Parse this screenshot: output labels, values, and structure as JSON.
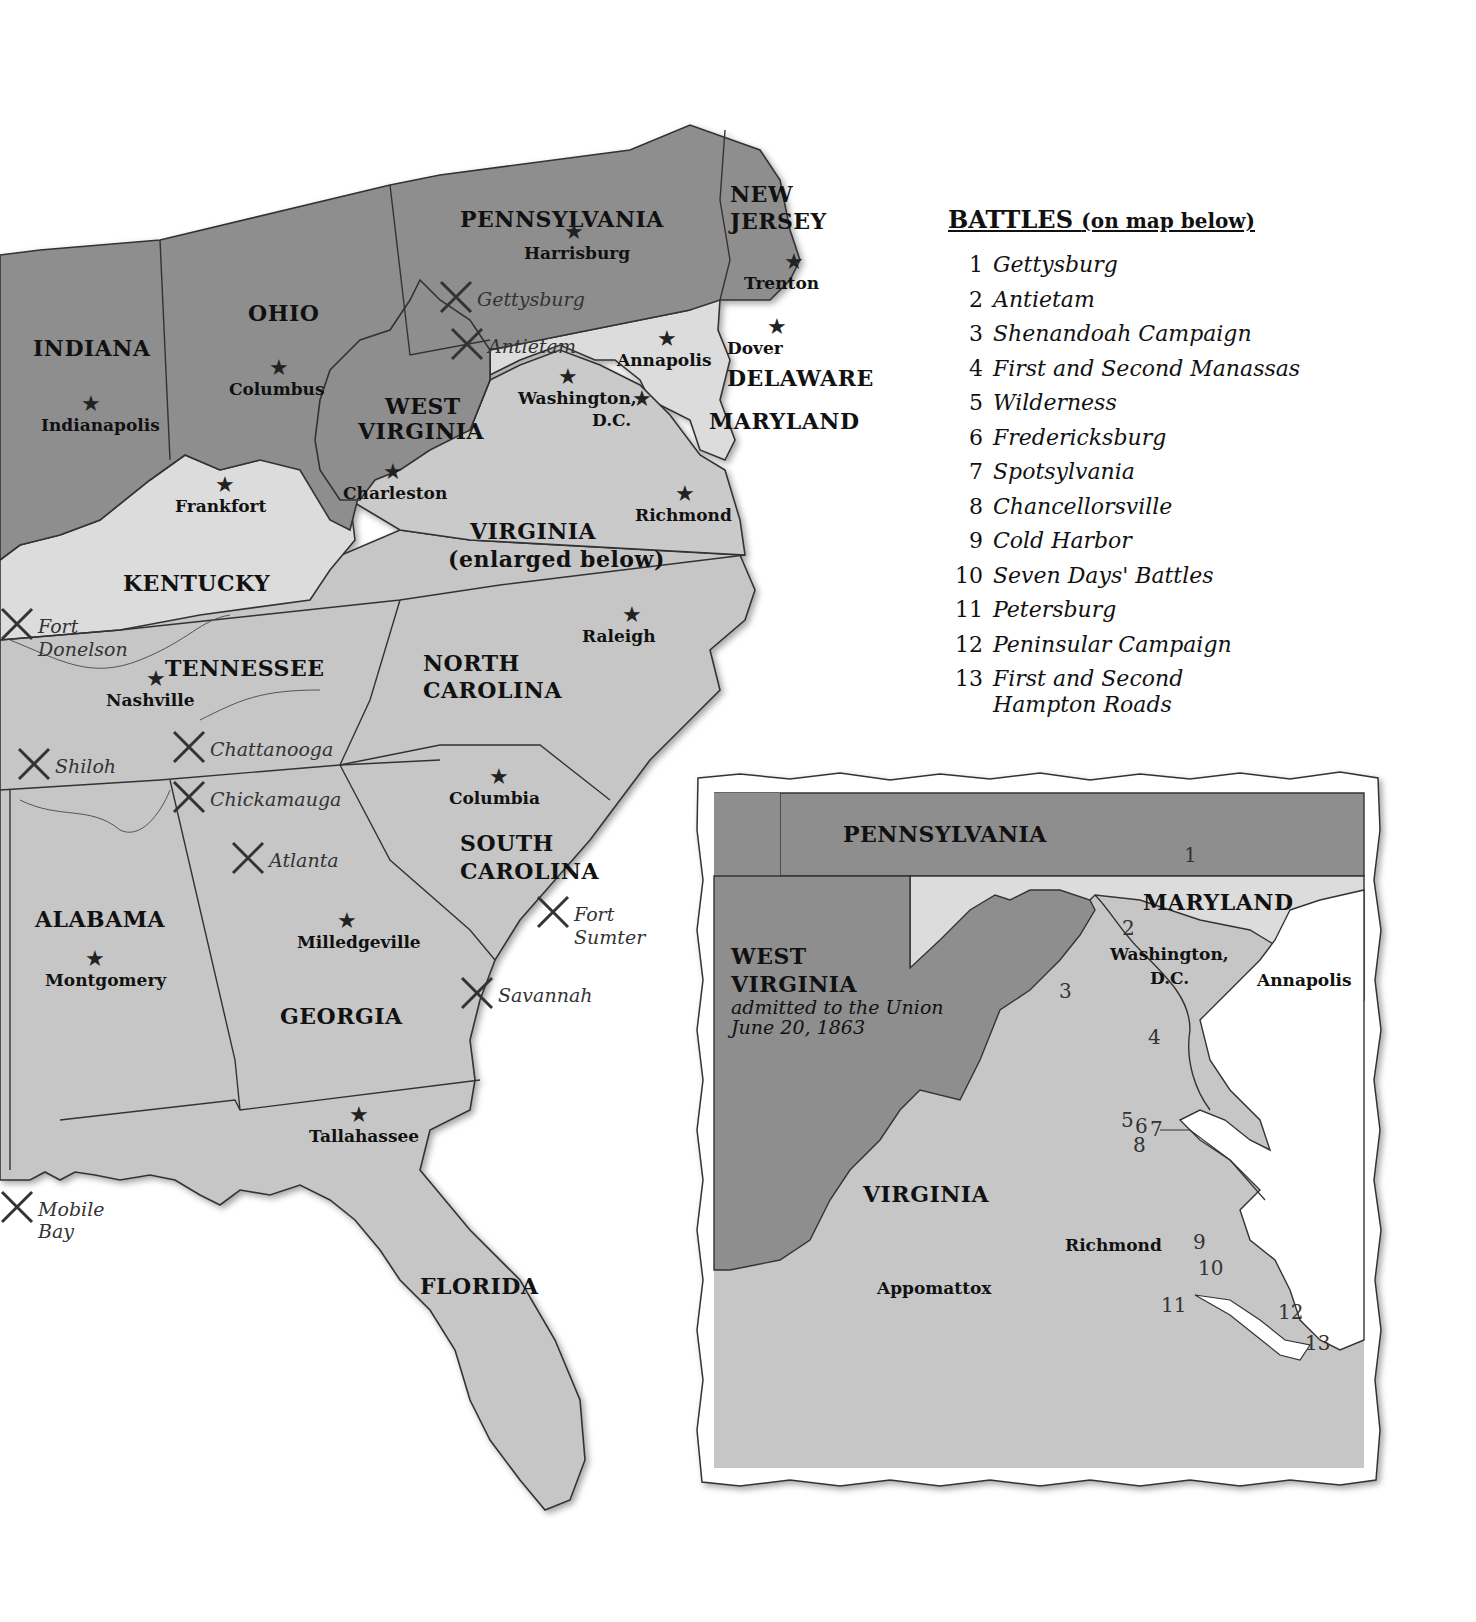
{
  "legend": {
    "title": "BATTLES",
    "subtitle": "(on map below)",
    "items": [
      {
        "num": "1",
        "name": "Gettysburg"
      },
      {
        "num": "2",
        "name": "Antietam"
      },
      {
        "num": "3",
        "name": "Shenandoah Campaign"
      },
      {
        "num": "4",
        "name": "First and Second Manassas"
      },
      {
        "num": "5",
        "name": "Wilderness"
      },
      {
        "num": "6",
        "name": "Fredericksburg"
      },
      {
        "num": "7",
        "name": "Spotsylvania"
      },
      {
        "num": "8",
        "name": "Chancellorsville"
      },
      {
        "num": "9",
        "name": "Cold Harbor"
      },
      {
        "num": "10",
        "name": "Seven Days' Battles"
      },
      {
        "num": "11",
        "name": "Petersburg"
      },
      {
        "num": "12",
        "name": "Peninsular Campaign"
      },
      {
        "num": "13",
        "name": "First and Second Hampton Roads"
      }
    ]
  },
  "main_map": {
    "colors": {
      "union": "#8f8f8f",
      "border_state": "#d8d8d8",
      "confederate": "#c4c4c4",
      "water": "#ffffff",
      "line": "#333333"
    },
    "states": [
      {
        "name": "PENNSYLVANIA",
        "x": 460,
        "y": 208
      },
      {
        "name": "NEW",
        "x": 730,
        "y": 183
      },
      {
        "name": "JERSEY",
        "x": 730,
        "y": 210
      },
      {
        "name": "OHIO",
        "x": 248,
        "y": 302
      },
      {
        "name": "INDIANA",
        "x": 33,
        "y": 337
      },
      {
        "name": "WEST",
        "x": 385,
        "y": 395
      },
      {
        "name": "VIRGINIA",
        "x": 358,
        "y": 420
      },
      {
        "name": "DELAWARE",
        "x": 727,
        "y": 367
      },
      {
        "name": "MARYLAND",
        "x": 709,
        "y": 410
      },
      {
        "name": "VIRGINIA",
        "x": 470,
        "y": 520
      },
      {
        "name": "(enlarged below)",
        "x": 448,
        "y": 548
      },
      {
        "name": "KENTUCKY",
        "x": 123,
        "y": 572
      },
      {
        "name": "TENNESSEE",
        "x": 165,
        "y": 657
      },
      {
        "name": "NORTH",
        "x": 423,
        "y": 652
      },
      {
        "name": "CAROLINA",
        "x": 423,
        "y": 679
      },
      {
        "name": "SOUTH",
        "x": 460,
        "y": 832
      },
      {
        "name": "CAROLINA",
        "x": 460,
        "y": 860
      },
      {
        "name": "ALABAMA",
        "x": 35,
        "y": 908
      },
      {
        "name": "GEORGIA",
        "x": 280,
        "y": 1005
      },
      {
        "name": "FLORIDA",
        "x": 420,
        "y": 1275
      }
    ],
    "capitals": [
      {
        "name": "Harrisburg",
        "x": 524,
        "y": 245
      },
      {
        "name": "Trenton",
        "x": 744,
        "y": 275
      },
      {
        "name": "Dover",
        "x": 727,
        "y": 340
      },
      {
        "name": "Annapolis",
        "x": 617,
        "y": 352
      },
      {
        "name": "Washington,",
        "x": 518,
        "y": 390
      },
      {
        "name": "D.C.",
        "x": 592,
        "y": 412
      },
      {
        "name": "Columbus",
        "x": 229,
        "y": 381
      },
      {
        "name": "Indianapolis",
        "x": 41,
        "y": 417
      },
      {
        "name": "Charleston",
        "x": 343,
        "y": 485
      },
      {
        "name": "Frankfort",
        "x": 175,
        "y": 498
      },
      {
        "name": "Richmond",
        "x": 635,
        "y": 507
      },
      {
        "name": "Raleigh",
        "x": 582,
        "y": 628
      },
      {
        "name": "Nashville",
        "x": 106,
        "y": 692
      },
      {
        "name": "Columbia",
        "x": 449,
        "y": 790
      },
      {
        "name": "Milledgeville",
        "x": 297,
        "y": 934
      },
      {
        "name": "Montgomery",
        "x": 45,
        "y": 972
      },
      {
        "name": "Tallahassee",
        "x": 309,
        "y": 1128
      }
    ],
    "battles": [
      {
        "name": "Gettysburg",
        "x": 477,
        "y": 290
      },
      {
        "name": "Antietam",
        "x": 488,
        "y": 337
      },
      {
        "name": "Fort",
        "x": 38,
        "y": 617
      },
      {
        "name": "Donelson",
        "x": 38,
        "y": 640
      },
      {
        "name": "Chattanooga",
        "x": 210,
        "y": 740
      },
      {
        "name": "Shiloh",
        "x": 55,
        "y": 757
      },
      {
        "name": "Chickamauga",
        "x": 210,
        "y": 790
      },
      {
        "name": "Atlanta",
        "x": 269,
        "y": 851
      },
      {
        "name": "Fort",
        "x": 574,
        "y": 905
      },
      {
        "name": "Sumter",
        "x": 574,
        "y": 928
      },
      {
        "name": "Savannah",
        "x": 498,
        "y": 986
      },
      {
        "name": "Mobile",
        "x": 38,
        "y": 1200
      },
      {
        "name": "Bay",
        "x": 38,
        "y": 1222
      }
    ]
  },
  "inset_map": {
    "states": [
      {
        "name": "PENNSYLVANIA",
        "x": 843,
        "y": 823
      },
      {
        "name": "MARYLAND",
        "x": 1143,
        "y": 891
      },
      {
        "name": "WEST",
        "x": 731,
        "y": 945
      },
      {
        "name": "VIRGINIA",
        "x": 731,
        "y": 973
      },
      {
        "name": "VIRGINIA",
        "x": 863,
        "y": 1183
      }
    ],
    "note_line1": "admitted to the Union",
    "note_line2": "June 20, 1863",
    "cities": [
      {
        "name": "Washington,",
        "x": 1110,
        "y": 946
      },
      {
        "name": "D.C.",
        "x": 1150,
        "y": 970
      },
      {
        "name": "Annapolis",
        "x": 1257,
        "y": 972
      },
      {
        "name": "Richmond",
        "x": 1065,
        "y": 1237
      },
      {
        "name": "Appomattox",
        "x": 877,
        "y": 1280
      }
    ],
    "battle_numbers": [
      {
        "num": "1",
        "x": 1184,
        "y": 845
      },
      {
        "num": "2",
        "x": 1122,
        "y": 918
      },
      {
        "num": "3",
        "x": 1059,
        "y": 981
      },
      {
        "num": "4",
        "x": 1148,
        "y": 1027
      },
      {
        "num": "5",
        "x": 1121,
        "y": 1110
      },
      {
        "num": "6",
        "x": 1135,
        "y": 1116
      },
      {
        "num": "7",
        "x": 1150,
        "y": 1119
      },
      {
        "num": "8",
        "x": 1133,
        "y": 1135
      },
      {
        "num": "9",
        "x": 1193,
        "y": 1232
      },
      {
        "name": "10",
        "num": "10",
        "x": 1198,
        "y": 1258
      },
      {
        "num": "11",
        "x": 1161,
        "y": 1295
      },
      {
        "num": "12",
        "x": 1278,
        "y": 1302
      },
      {
        "num": "13",
        "x": 1305,
        "y": 1333
      }
    ]
  }
}
